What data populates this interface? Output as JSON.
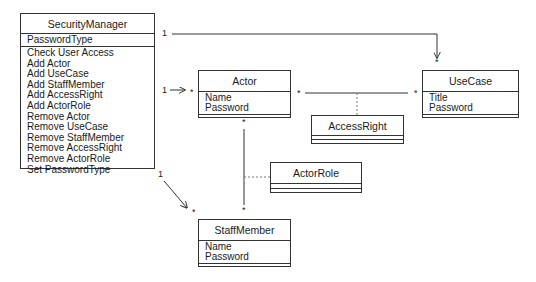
{
  "classes": {
    "security_manager": {
      "name": "SecurityManager",
      "attributes": [
        "PasswordType"
      ],
      "operations": [
        "Check User Access",
        "Add Actor",
        "Add UseCase",
        "Add StaffMember",
        "Add AccessRight",
        "Add ActorRole",
        "Remove Actor",
        "Remove UseCase",
        "Remove StaffMember",
        "Remove AccessRight",
        "Remove ActorRole",
        "Set PasswordType"
      ]
    },
    "actor": {
      "name": "Actor",
      "attributes": [
        "Name",
        "Password"
      ]
    },
    "use_case": {
      "name": "UseCase",
      "attributes": [
        "Title",
        "Password"
      ]
    },
    "access_right": {
      "name": "AccessRight",
      "attributes": []
    },
    "actor_role": {
      "name": "ActorRole",
      "attributes": []
    },
    "staff_member": {
      "name": "StaffMember",
      "attributes": [
        "Name",
        "Password"
      ]
    }
  },
  "multiplicities": {
    "sm_usecase_source": "1",
    "sm_usecase_target": "*",
    "sm_actor_source": "1",
    "sm_actor_target": "*",
    "sm_staff_source": "1",
    "sm_staff_target": "*",
    "actor_usecase_left": "*",
    "actor_usecase_right": "*",
    "actor_staff_top": "*",
    "actor_staff_bottom": "*"
  },
  "associations": [
    {
      "from": "SecurityManager",
      "to": "UseCase",
      "type": "directed",
      "from_mult": "1",
      "to_mult": "*"
    },
    {
      "from": "SecurityManager",
      "to": "Actor",
      "type": "directed",
      "from_mult": "1",
      "to_mult": "*"
    },
    {
      "from": "SecurityManager",
      "to": "StaffMember",
      "type": "directed",
      "from_mult": "1",
      "to_mult": "*"
    },
    {
      "from": "Actor",
      "to": "UseCase",
      "type": "association",
      "from_mult": "*",
      "to_mult": "*",
      "association_class": "AccessRight"
    },
    {
      "from": "Actor",
      "to": "StaffMember",
      "type": "association",
      "from_mult": "*",
      "to_mult": "*",
      "association_class": "ActorRole"
    }
  ],
  "colors": {
    "line": "#333333",
    "background": "#ffffff",
    "text": "#1a1a1a"
  }
}
